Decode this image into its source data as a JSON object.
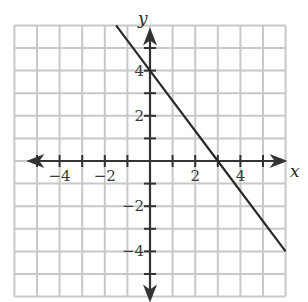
{
  "chart_data": {
    "type": "line",
    "title": "",
    "xlabel": "x",
    "ylabel": "y",
    "xlim": [
      -6,
      6
    ],
    "ylim": [
      -6,
      6
    ],
    "grid": true,
    "x_tick_labels": [
      {
        "value": -4,
        "label": "−4"
      },
      {
        "value": -2,
        "label": "−2"
      },
      {
        "value": 2,
        "label": "2"
      },
      {
        "value": 4,
        "label": "4"
      }
    ],
    "y_tick_labels": [
      {
        "value": 4,
        "label": "4"
      },
      {
        "value": 2,
        "label": "2"
      },
      {
        "value": -2,
        "label": "−2"
      },
      {
        "value": -4,
        "label": "−4"
      }
    ],
    "series": [
      {
        "name": "line",
        "equation": "y = -4/3 x + 4",
        "x": [
          -1.5,
          0,
          3,
          6
        ],
        "y": [
          6,
          4,
          0,
          -4
        ]
      }
    ],
    "colors": {
      "grid": "#c8c8c8",
      "axes": "#333333",
      "line": "#2a2a2a"
    }
  }
}
